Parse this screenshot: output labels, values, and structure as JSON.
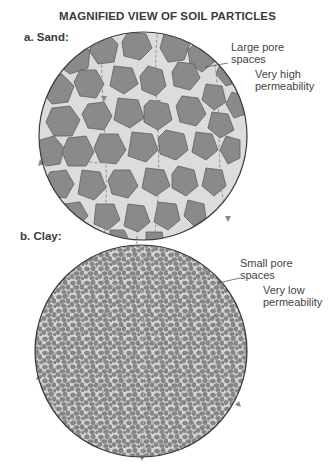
{
  "title": "MAGNIFIED VIEW OF SOIL PARTICLES",
  "panels": [
    {
      "label": "a. Sand:",
      "pore_label_line1": "Large pore",
      "pore_label_line2": "spaces",
      "permeability_line1": "Very high",
      "permeability_line2": "permeability"
    },
    {
      "label": "b. Clay:",
      "pore_label_line1": "Small pore",
      "pore_label_line2": "spaces",
      "permeability_line1": "Very low",
      "permeability_line2": "permeability"
    }
  ],
  "colors": {
    "particle": "#8a8a8a",
    "pore": "#dcdcdc",
    "outline": "#3a3a3a",
    "flow_arrow": "#888888"
  }
}
